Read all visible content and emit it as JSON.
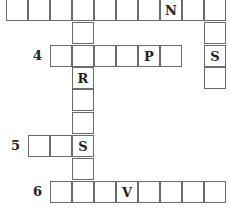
{
  "puzzle": {
    "clue_numbers": {
      "row4": "4",
      "row5": "5",
      "row6": "6"
    },
    "letters": {
      "across1_N": "N",
      "down_right_S": "S",
      "across4_P": "P",
      "down_R": "R",
      "across5_S": "S",
      "across6_V": "V"
    },
    "entries": [
      {
        "name": "across-top",
        "length": 10,
        "given": {
          "8": "N"
        }
      },
      {
        "name": "down-right",
        "length": 4,
        "given": {
          "3": "S"
        }
      },
      {
        "name": "across-4",
        "number": "4",
        "length": 6,
        "given": {
          "5": "P"
        }
      },
      {
        "name": "down-long",
        "length": 9,
        "given": {
          "3": "R",
          "6": "S"
        }
      },
      {
        "name": "across-5",
        "number": "5",
        "length": 3,
        "given": {
          "3": "S"
        }
      },
      {
        "name": "across-6",
        "number": "6",
        "length": 8,
        "given": {
          "4": "V"
        }
      }
    ]
  }
}
